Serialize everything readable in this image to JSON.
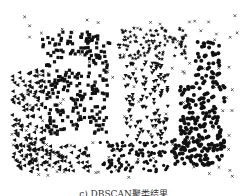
{
  "chart_data": {
    "type": "scatter",
    "title": "",
    "caption": "c) DBSCAN聚类结果",
    "xlabel": "",
    "ylabel": "",
    "grid": false,
    "axes_visible": false,
    "plot_box": [
      10,
      15,
      240,
      178
    ],
    "series": [
      {
        "name": "cluster-square-frame",
        "marker": "square",
        "color": "#111111",
        "regions": [
          [
            42,
            32,
            110,
            55
          ],
          [
            45,
            55,
            62,
            135
          ],
          [
            62,
            70,
            85,
            130
          ],
          [
            88,
            55,
            108,
            135
          ]
        ],
        "count": 260
      },
      {
        "name": "cluster-left-triangles",
        "marker": "triangle-left",
        "color": "#111111",
        "regions": [
          [
            12,
            70,
            45,
            165
          ],
          [
            15,
            145,
            90,
            172
          ]
        ],
        "count": 230
      },
      {
        "name": "cluster-top-stars",
        "marker": "star",
        "color": "#111111",
        "regions": [
          [
            118,
            28,
            188,
            60
          ]
        ],
        "count": 110
      },
      {
        "name": "cluster-center-triangles-down",
        "marker": "triangle-down",
        "color": "#111111",
        "regions": [
          [
            125,
            62,
            168,
            140
          ]
        ],
        "count": 120
      },
      {
        "name": "cluster-bottom-dots",
        "marker": "circle-small",
        "color": "#111111",
        "regions": [
          [
            100,
            142,
            168,
            172
          ]
        ],
        "count": 110
      },
      {
        "name": "cluster-right-circles",
        "marker": "circle",
        "color": "#111111",
        "regions": [
          [
            195,
            42,
            220,
            80
          ],
          [
            180,
            80,
            225,
            160
          ],
          [
            172,
            140,
            220,
            165
          ]
        ],
        "count": 260
      },
      {
        "name": "noise",
        "marker": "x",
        "color": "#333333",
        "regions": [
          [
            10,
            15,
            240,
            178
          ]
        ],
        "count": 110
      }
    ]
  }
}
